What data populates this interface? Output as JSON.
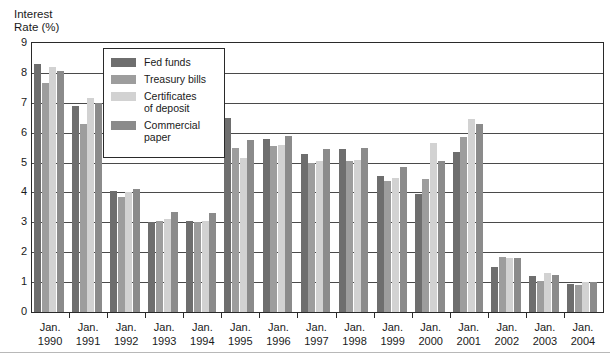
{
  "axis": {
    "y_title": "Interest\nRate (%)",
    "y_ticks": [
      "9",
      "8",
      "7",
      "6",
      "5",
      "4",
      "3",
      "2",
      "1",
      "0"
    ]
  },
  "legend": {
    "items": [
      {
        "label": "Fed funds",
        "color": "#6e6e6e",
        "swatch_name": "legend-swatch-fed-funds"
      },
      {
        "label": "Treasury bills",
        "color": "#9d9d9d",
        "swatch_name": "legend-swatch-treasury-bills"
      },
      {
        "label": "Certificates\nof deposit",
        "color": "#d2d2d2",
        "swatch_name": "legend-swatch-certificates-of-deposit"
      },
      {
        "label": "Commercial\npaper",
        "color": "#8b8b8b",
        "swatch_name": "legend-swatch-commercial-paper"
      }
    ]
  },
  "x_labels": [
    {
      "month": "Jan.",
      "year": "1990"
    },
    {
      "month": "Jan.",
      "year": "1991"
    },
    {
      "month": "Jan.",
      "year": "1992"
    },
    {
      "month": "Jan.",
      "year": "1993"
    },
    {
      "month": "Jan.",
      "year": "1994"
    },
    {
      "month": "Jan.",
      "year": "1995"
    },
    {
      "month": "Jan.",
      "year": "1996"
    },
    {
      "month": "Jan.",
      "year": "1997"
    },
    {
      "month": "Jan.",
      "year": "1998"
    },
    {
      "month": "Jan.",
      "year": "1999"
    },
    {
      "month": "Jan.",
      "year": "2000"
    },
    {
      "month": "Jan.",
      "year": "2001"
    },
    {
      "month": "Jan.",
      "year": "2002"
    },
    {
      "month": "Jan.",
      "year": "2003"
    },
    {
      "month": "Jan.",
      "year": "2004"
    }
  ],
  "chart_data": {
    "type": "bar",
    "title": "",
    "xlabel": "",
    "ylabel": "Interest Rate (%)",
    "ylim": [
      0,
      9
    ],
    "ytick_step": 1,
    "grid": true,
    "legend_position": "inside-top-left",
    "categories": [
      "Jan. 1990",
      "Jan. 1991",
      "Jan. 1992",
      "Jan. 1993",
      "Jan. 1994",
      "Jan. 1995",
      "Jan. 1996",
      "Jan. 1997",
      "Jan. 1998",
      "Jan. 1999",
      "Jan. 2000",
      "Jan. 2001",
      "Jan. 2002",
      "Jan. 2003",
      "Jan. 2004"
    ],
    "series": [
      {
        "name": "Fed funds",
        "color": "#6e6e6e",
        "values": [
          8.3,
          6.9,
          4.05,
          3.0,
          3.05,
          6.5,
          5.8,
          5.3,
          5.45,
          4.55,
          3.95,
          5.35,
          1.5,
          1.2,
          0.95
        ]
      },
      {
        "name": "Treasury bills",
        "color": "#9d9d9d",
        "values": [
          7.65,
          6.3,
          3.85,
          3.05,
          3.0,
          5.5,
          5.55,
          5.0,
          5.05,
          4.4,
          4.45,
          5.85,
          1.85,
          1.05,
          0.9
        ]
      },
      {
        "name": "Certificates of deposit",
        "color": "#d2d2d2",
        "values": [
          8.2,
          7.15,
          4.0,
          3.1,
          3.05,
          5.15,
          5.6,
          5.05,
          5.1,
          4.5,
          5.65,
          6.45,
          1.8,
          1.3,
          1.0
        ]
      },
      {
        "name": "Commercial paper",
        "color": "#8b8b8b",
        "values": [
          8.05,
          7.0,
          4.1,
          3.35,
          3.3,
          5.75,
          5.9,
          5.45,
          5.5,
          4.85,
          5.05,
          6.3,
          1.8,
          1.25,
          1.0
        ]
      }
    ]
  }
}
